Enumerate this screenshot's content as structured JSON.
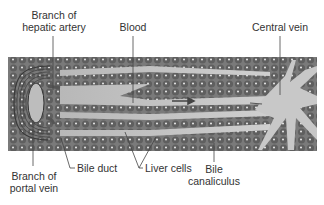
{
  "diagram": {
    "labels": {
      "hepatic_artery": [
        "Branch of",
        "hepatic artery"
      ],
      "blood": "Blood",
      "central_vein": "Central vein",
      "portal_vein": [
        "Branch of",
        "portal vein"
      ],
      "bile_duct": "Bile duct",
      "liver_cells": "Liver cells",
      "bile_canaliculus": [
        "Bile",
        "canaliculus"
      ]
    },
    "colors": {
      "background": "#ffffff",
      "tissue_bg": "#8a8a8a",
      "sinusoid": "#c4c4c4",
      "cell": "#6e6e6e",
      "nucleus": "#e8e8e8",
      "text": "#333333",
      "leader": "#444444"
    }
  }
}
